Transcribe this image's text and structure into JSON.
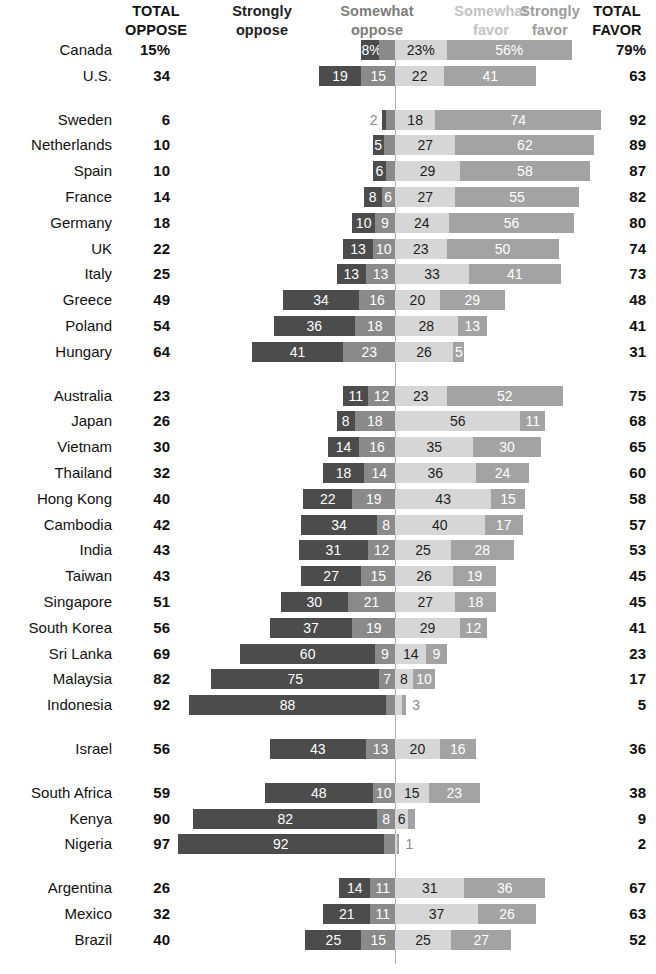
{
  "header": {
    "total_oppose": {
      "line1": "TOTAL",
      "line2": "OPPOSE"
    },
    "strongly_oppose": {
      "line1": "Strongly",
      "line2": "oppose"
    },
    "somewhat_oppose": {
      "line1": "Somewhat",
      "line2": "oppose"
    },
    "somewhat_favor": {
      "line1": "Somewhat",
      "line2": "favor"
    },
    "strongly_favor": {
      "line1": "Strongly",
      "line2": "favor"
    },
    "total_favor": {
      "line1": "TOTAL",
      "line2": "FAVOR"
    }
  },
  "colors": {
    "strongly_oppose": "#4c4c4c",
    "somewhat_oppose": "#8a8a8a",
    "somewhat_favor": "#d6d6d6",
    "strongly_favor": "#a3a3a3",
    "divider": "#aeaeae",
    "text": "#111111"
  },
  "chart_data": {
    "type": "bar",
    "subtype": "diverging-stacked-bar",
    "title": "",
    "xlabel": "",
    "ylabel": "",
    "series": [
      {
        "name": "Strongly oppose",
        "key": "strongly_oppose",
        "color": "#4c4c4c"
      },
      {
        "name": "Somewhat oppose",
        "key": "somewhat_oppose",
        "color": "#8a8a8a"
      },
      {
        "name": "Somewhat favor",
        "key": "somewhat_favor",
        "color": "#d6d6d6"
      },
      {
        "name": "Strongly favor",
        "key": "strongly_favor",
        "color": "#a3a3a3"
      }
    ],
    "groups": [
      {
        "name": "North America",
        "rows": [
          {
            "country": "Canada",
            "total_oppose": "15%",
            "total_favor": "79%",
            "strongly_oppose": 8,
            "somewhat_oppose": 7,
            "somewhat_favor": 23,
            "strongly_favor": 56,
            "labels": {
              "strongly_oppose": "8%",
              "somewhat_oppose": "7%",
              "somewhat_favor": "23%",
              "strongly_favor": "56%"
            }
          },
          {
            "country": "U.S.",
            "total_oppose": "34",
            "total_favor": "63",
            "strongly_oppose": 19,
            "somewhat_oppose": 15,
            "somewhat_favor": 22,
            "strongly_favor": 41,
            "labels": {
              "strongly_oppose": "19",
              "somewhat_oppose": "15",
              "somewhat_favor": "22",
              "strongly_favor": "41"
            }
          }
        ]
      },
      {
        "name": "Europe",
        "rows": [
          {
            "country": "Sweden",
            "total_oppose": "6",
            "total_favor": "92",
            "strongly_oppose": 2,
            "somewhat_oppose": 4,
            "somewhat_favor": 18,
            "strongly_favor": 74,
            "labels": {
              "strongly_oppose": "2",
              "somewhat_oppose": "",
              "somewhat_favor": "18",
              "strongly_favor": "74"
            }
          },
          {
            "country": "Netherlands",
            "total_oppose": "10",
            "total_favor": "89",
            "strongly_oppose": 5,
            "somewhat_oppose": 5,
            "somewhat_favor": 27,
            "strongly_favor": 62,
            "labels": {
              "strongly_oppose": "5",
              "somewhat_oppose": "",
              "somewhat_favor": "27",
              "strongly_favor": "62"
            }
          },
          {
            "country": "Spain",
            "total_oppose": "10",
            "total_favor": "87",
            "strongly_oppose": 6,
            "somewhat_oppose": 4,
            "somewhat_favor": 29,
            "strongly_favor": 58,
            "labels": {
              "strongly_oppose": "6",
              "somewhat_oppose": "",
              "somewhat_favor": "29",
              "strongly_favor": "58"
            }
          },
          {
            "country": "France",
            "total_oppose": "14",
            "total_favor": "82",
            "strongly_oppose": 8,
            "somewhat_oppose": 6,
            "somewhat_favor": 27,
            "strongly_favor": 55,
            "labels": {
              "strongly_oppose": "8",
              "somewhat_oppose": "6",
              "somewhat_favor": "27",
              "strongly_favor": "55"
            }
          },
          {
            "country": "Germany",
            "total_oppose": "18",
            "total_favor": "80",
            "strongly_oppose": 10,
            "somewhat_oppose": 9,
            "somewhat_favor": 24,
            "strongly_favor": 56,
            "labels": {
              "strongly_oppose": "10",
              "somewhat_oppose": "9",
              "somewhat_favor": "24",
              "strongly_favor": "56"
            }
          },
          {
            "country": "UK",
            "total_oppose": "22",
            "total_favor": "74",
            "strongly_oppose": 13,
            "somewhat_oppose": 10,
            "somewhat_favor": 23,
            "strongly_favor": 50,
            "labels": {
              "strongly_oppose": "13",
              "somewhat_oppose": "10",
              "somewhat_favor": "23",
              "strongly_favor": "50"
            }
          },
          {
            "country": "Italy",
            "total_oppose": "25",
            "total_favor": "73",
            "strongly_oppose": 13,
            "somewhat_oppose": 13,
            "somewhat_favor": 33,
            "strongly_favor": 41,
            "labels": {
              "strongly_oppose": "13",
              "somewhat_oppose": "13",
              "somewhat_favor": "33",
              "strongly_favor": "41"
            }
          },
          {
            "country": "Greece",
            "total_oppose": "49",
            "total_favor": "48",
            "strongly_oppose": 34,
            "somewhat_oppose": 16,
            "somewhat_favor": 20,
            "strongly_favor": 29,
            "labels": {
              "strongly_oppose": "34",
              "somewhat_oppose": "16",
              "somewhat_favor": "20",
              "strongly_favor": "29"
            }
          },
          {
            "country": "Poland",
            "total_oppose": "54",
            "total_favor": "41",
            "strongly_oppose": 36,
            "somewhat_oppose": 18,
            "somewhat_favor": 28,
            "strongly_favor": 13,
            "labels": {
              "strongly_oppose": "36",
              "somewhat_oppose": "18",
              "somewhat_favor": "28",
              "strongly_favor": "13"
            }
          },
          {
            "country": "Hungary",
            "total_oppose": "64",
            "total_favor": "31",
            "strongly_oppose": 41,
            "somewhat_oppose": 23,
            "somewhat_favor": 26,
            "strongly_favor": 5,
            "labels": {
              "strongly_oppose": "41",
              "somewhat_oppose": "23",
              "somewhat_favor": "26",
              "strongly_favor": "5"
            }
          }
        ]
      },
      {
        "name": "Asia-Pacific",
        "rows": [
          {
            "country": "Australia",
            "total_oppose": "23",
            "total_favor": "75",
            "strongly_oppose": 11,
            "somewhat_oppose": 12,
            "somewhat_favor": 23,
            "strongly_favor": 52,
            "labels": {
              "strongly_oppose": "11",
              "somewhat_oppose": "12",
              "somewhat_favor": "23",
              "strongly_favor": "52"
            }
          },
          {
            "country": "Japan",
            "total_oppose": "26",
            "total_favor": "68",
            "strongly_oppose": 8,
            "somewhat_oppose": 18,
            "somewhat_favor": 56,
            "strongly_favor": 11,
            "labels": {
              "strongly_oppose": "8",
              "somewhat_oppose": "18",
              "somewhat_favor": "56",
              "strongly_favor": "11"
            }
          },
          {
            "country": "Vietnam",
            "total_oppose": "30",
            "total_favor": "65",
            "strongly_oppose": 14,
            "somewhat_oppose": 16,
            "somewhat_favor": 35,
            "strongly_favor": 30,
            "labels": {
              "strongly_oppose": "14",
              "somewhat_oppose": "16",
              "somewhat_favor": "35",
              "strongly_favor": "30"
            }
          },
          {
            "country": "Thailand",
            "total_oppose": "32",
            "total_favor": "60",
            "strongly_oppose": 18,
            "somewhat_oppose": 14,
            "somewhat_favor": 36,
            "strongly_favor": 24,
            "labels": {
              "strongly_oppose": "18",
              "somewhat_oppose": "14",
              "somewhat_favor": "36",
              "strongly_favor": "24"
            }
          },
          {
            "country": "Hong Kong",
            "total_oppose": "40",
            "total_favor": "58",
            "strongly_oppose": 22,
            "somewhat_oppose": 19,
            "somewhat_favor": 43,
            "strongly_favor": 15,
            "labels": {
              "strongly_oppose": "22",
              "somewhat_oppose": "19",
              "somewhat_favor": "43",
              "strongly_favor": "15"
            }
          },
          {
            "country": "Cambodia",
            "total_oppose": "42",
            "total_favor": "57",
            "strongly_oppose": 34,
            "somewhat_oppose": 8,
            "somewhat_favor": 40,
            "strongly_favor": 17,
            "labels": {
              "strongly_oppose": "34",
              "somewhat_oppose": "8",
              "somewhat_favor": "40",
              "strongly_favor": "17"
            }
          },
          {
            "country": "India",
            "total_oppose": "43",
            "total_favor": "53",
            "strongly_oppose": 31,
            "somewhat_oppose": 12,
            "somewhat_favor": 25,
            "strongly_favor": 28,
            "labels": {
              "strongly_oppose": "31",
              "somewhat_oppose": "12",
              "somewhat_favor": "25",
              "strongly_favor": "28"
            }
          },
          {
            "country": "Taiwan",
            "total_oppose": "43",
            "total_favor": "45",
            "strongly_oppose": 27,
            "somewhat_oppose": 15,
            "somewhat_favor": 26,
            "strongly_favor": 19,
            "labels": {
              "strongly_oppose": "27",
              "somewhat_oppose": "15",
              "somewhat_favor": "26",
              "strongly_favor": "19"
            }
          },
          {
            "country": "Singapore",
            "total_oppose": "51",
            "total_favor": "45",
            "strongly_oppose": 30,
            "somewhat_oppose": 21,
            "somewhat_favor": 27,
            "strongly_favor": 18,
            "labels": {
              "strongly_oppose": "30",
              "somewhat_oppose": "21",
              "somewhat_favor": "27",
              "strongly_favor": "18"
            }
          },
          {
            "country": "South Korea",
            "total_oppose": "56",
            "total_favor": "41",
            "strongly_oppose": 37,
            "somewhat_oppose": 19,
            "somewhat_favor": 29,
            "strongly_favor": 12,
            "labels": {
              "strongly_oppose": "37",
              "somewhat_oppose": "19",
              "somewhat_favor": "29",
              "strongly_favor": "12"
            }
          },
          {
            "country": "Sri Lanka",
            "total_oppose": "69",
            "total_favor": "23",
            "strongly_oppose": 60,
            "somewhat_oppose": 9,
            "somewhat_favor": 14,
            "strongly_favor": 9,
            "labels": {
              "strongly_oppose": "60",
              "somewhat_oppose": "9",
              "somewhat_favor": "14",
              "strongly_favor": "9"
            }
          },
          {
            "country": "Malaysia",
            "total_oppose": "82",
            "total_favor": "17",
            "strongly_oppose": 75,
            "somewhat_oppose": 7,
            "somewhat_favor": 8,
            "strongly_favor": 10,
            "labels": {
              "strongly_oppose": "75",
              "somewhat_oppose": "7",
              "somewhat_favor": "8",
              "strongly_favor": "10"
            }
          },
          {
            "country": "Indonesia",
            "total_oppose": "92",
            "total_favor": "5",
            "strongly_oppose": 88,
            "somewhat_oppose": 4,
            "somewhat_favor": 3,
            "strongly_favor": 2,
            "labels": {
              "strongly_oppose": "88",
              "somewhat_oppose": "",
              "somewhat_favor": "3",
              "strongly_favor": ""
            }
          }
        ]
      },
      {
        "name": "Middle East",
        "rows": [
          {
            "country": "Israel",
            "total_oppose": "56",
            "total_favor": "36",
            "strongly_oppose": 43,
            "somewhat_oppose": 13,
            "somewhat_favor": 20,
            "strongly_favor": 16,
            "labels": {
              "strongly_oppose": "43",
              "somewhat_oppose": "13",
              "somewhat_favor": "20",
              "strongly_favor": "16"
            }
          }
        ]
      },
      {
        "name": "Sub-Saharan Africa",
        "rows": [
          {
            "country": "South Africa",
            "total_oppose": "59",
            "total_favor": "38",
            "strongly_oppose": 48,
            "somewhat_oppose": 10,
            "somewhat_favor": 15,
            "strongly_favor": 23,
            "labels": {
              "strongly_oppose": "48",
              "somewhat_oppose": "10",
              "somewhat_favor": "15",
              "strongly_favor": "23"
            }
          },
          {
            "country": "Kenya",
            "total_oppose": "90",
            "total_favor": "9",
            "strongly_oppose": 82,
            "somewhat_oppose": 8,
            "somewhat_favor": 6,
            "strongly_favor": 3,
            "labels": {
              "strongly_oppose": "82",
              "somewhat_oppose": "8",
              "somewhat_favor": "6",
              "strongly_favor": "3"
            }
          },
          {
            "country": "Nigeria",
            "total_oppose": "97",
            "total_favor": "2",
            "strongly_oppose": 92,
            "somewhat_oppose": 5,
            "somewhat_favor": 1,
            "strongly_favor": 1,
            "labels": {
              "strongly_oppose": "92",
              "somewhat_oppose": "",
              "somewhat_favor": "1",
              "strongly_favor": ""
            }
          }
        ]
      },
      {
        "name": "Latin America",
        "rows": [
          {
            "country": "Argentina",
            "total_oppose": "26",
            "total_favor": "67",
            "strongly_oppose": 14,
            "somewhat_oppose": 11,
            "somewhat_favor": 31,
            "strongly_favor": 36,
            "labels": {
              "strongly_oppose": "14",
              "somewhat_oppose": "11",
              "somewhat_favor": "31",
              "strongly_favor": "36"
            }
          },
          {
            "country": "Mexico",
            "total_oppose": "32",
            "total_favor": "63",
            "strongly_oppose": 21,
            "somewhat_oppose": 11,
            "somewhat_favor": 37,
            "strongly_favor": 26,
            "labels": {
              "strongly_oppose": "21",
              "somewhat_oppose": "11",
              "somewhat_favor": "37",
              "strongly_favor": "26"
            }
          },
          {
            "country": "Brazil",
            "total_oppose": "40",
            "total_favor": "52",
            "strongly_oppose": 25,
            "somewhat_oppose": 15,
            "somewhat_favor": 25,
            "strongly_favor": 27,
            "labels": {
              "strongly_oppose": "25",
              "somewhat_oppose": "15",
              "somewhat_favor": "25",
              "strongly_favor": "27"
            }
          }
        ]
      }
    ]
  }
}
